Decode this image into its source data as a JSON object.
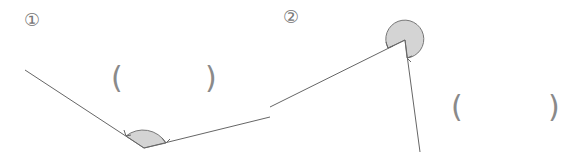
{
  "problems": [
    {
      "number_label": "①",
      "answer_open": "(",
      "answer_close": ")",
      "answer_value": "",
      "angle": {
        "type": "obtuse",
        "vertex": [
          144,
          148
        ],
        "ray_a_end": [
          25,
          70
        ],
        "ray_b_end": [
          270,
          117
        ]
      }
    },
    {
      "number_label": "②",
      "answer_open": "(",
      "answer_close": ")",
      "answer_value": "",
      "angle": {
        "type": "reflex",
        "vertex": [
          405,
          40
        ],
        "ray_a_end": [
          270,
          107
        ],
        "ray_b_end": [
          420,
          152
        ]
      }
    }
  ],
  "colors": {
    "line": "#666666",
    "arc_fill": "#d4d4d4",
    "arc_stroke": "#777777",
    "text": "#777777"
  }
}
